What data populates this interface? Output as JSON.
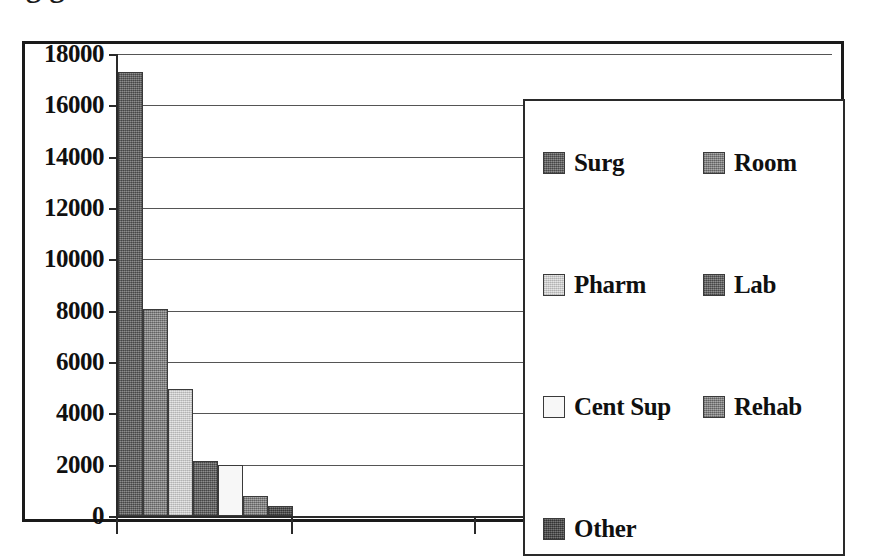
{
  "page": {
    "title_remnant": "g                                                  g"
  },
  "chart_data": {
    "type": "bar",
    "title": "",
    "subtitle": "",
    "xlabel": "",
    "ylabel": "",
    "categories": [
      "Surg",
      "Room",
      "Pharm",
      "Lab",
      "Cent Sup",
      "Rehab",
      "Other"
    ],
    "values": [
      17300,
      8050,
      4950,
      2130,
      1980,
      780,
      390
    ],
    "series": [
      {
        "name": "",
        "values": [
          17300,
          8050,
          4950,
          2130,
          1980,
          780,
          390
        ]
      }
    ],
    "ylim": [
      0,
      18000
    ],
    "ytick_labels": [
      "0",
      "2000",
      "4000",
      "6000",
      "8000",
      "10000",
      "12000",
      "14000",
      "16000",
      "18000"
    ],
    "ytick_values": [
      0,
      2000,
      4000,
      6000,
      8000,
      10000,
      12000,
      14000,
      16000,
      18000
    ],
    "grid": true,
    "grid_axis": "y",
    "xtick_labels": [],
    "legend_position": "inside-right",
    "bar_colors": [
      "#6e6e6e",
      "#8c8c8c",
      "#d6d6d6",
      "#6e6e6e",
      "#f7f7f7",
      "#8c8c8c",
      "#5a5a5a"
    ]
  },
  "legend": {
    "items": [
      {
        "label": "Surg",
        "swatch": "tex-dark"
      },
      {
        "label": "Room",
        "swatch": "tex-mid"
      },
      {
        "label": "Pharm",
        "swatch": "tex-light"
      },
      {
        "label": "Lab",
        "swatch": "tex-dark"
      },
      {
        "label": "Cent Sup",
        "swatch": "tex-white"
      },
      {
        "label": "Rehab",
        "swatch": "tex-mid"
      },
      {
        "label": "Other",
        "swatch": "tex-darker"
      }
    ]
  },
  "axis": {
    "ytick_0": "0",
    "ytick_1": "2000",
    "ytick_2": "4000",
    "ytick_3": "6000",
    "ytick_4": "8000",
    "ytick_5": "10000",
    "ytick_6": "12000",
    "ytick_7": "14000",
    "ytick_8": "16000",
    "ytick_9": "18000"
  }
}
